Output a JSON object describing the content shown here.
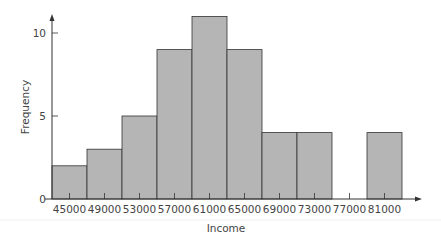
{
  "chart_data": {
    "type": "bar",
    "title": "",
    "xlabel": "Income",
    "ylabel": "Frequency",
    "categories": [
      "45000",
      "49000",
      "53000",
      "57000",
      "61000",
      "65000",
      "69000",
      "73000",
      "77000",
      "81000"
    ],
    "values": [
      2,
      3,
      5,
      9,
      11,
      9,
      4,
      4,
      0,
      4
    ],
    "yticks": [
      "0",
      "5",
      "10"
    ],
    "ylim": [
      0,
      11.5
    ],
    "grid": false,
    "legend": null,
    "bar_color": "#b5b5b5",
    "edge_color": "#333333"
  }
}
